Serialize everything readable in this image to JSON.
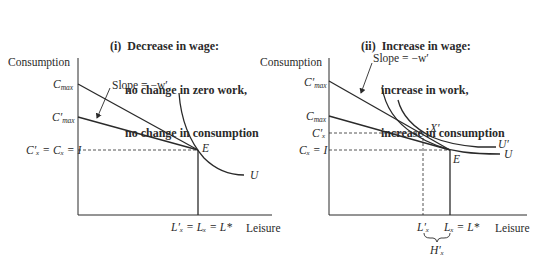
{
  "panels": [
    {
      "id": "i",
      "title_lines": [
        "(i)  Decrease in wage:",
        "no change in zero work,",
        "no change in consumption"
      ],
      "y_axis_label": "Consumption",
      "x_axis_label": "Leisure",
      "slope_label": "Slope = −w′",
      "y_labels": {
        "cmax": "C",
        "cmax_sub": "max",
        "cmax_prime": "C′",
        "cmax_prime_sub": "max",
        "equil": "C′ₓ = Cₓ = I"
      },
      "x_labels": {
        "equil": "L′ₓ = Lₓ = L*"
      },
      "points": {
        "E": "E"
      },
      "curves": {
        "U": "U"
      }
    },
    {
      "id": "ii",
      "title_lines": [
        "(ii)  Increase in wage:",
        "increase in work,",
        "increase in consumption"
      ],
      "y_axis_label": "Consumption",
      "x_axis_label": "Leisure",
      "slope_label": "Slope = −w′",
      "y_labels": {
        "cmax_prime": "C′",
        "cmax_prime_sub": "max",
        "cmax": "C",
        "cmax_sub": "max",
        "cx_prime": "C′ₓ",
        "cx": "Cₓ = I"
      },
      "x_labels": {
        "lx_prime": "L′ₓ",
        "lx": "Lₓ = L*",
        "hx_prime": "H′ₓ"
      },
      "points": {
        "E": "E",
        "X_prime": "X′"
      },
      "curves": {
        "U": "U",
        "U_prime": "U′"
      }
    }
  ],
  "colors": {
    "ink": "#2a2a2a",
    "background": "#ffffff"
  }
}
